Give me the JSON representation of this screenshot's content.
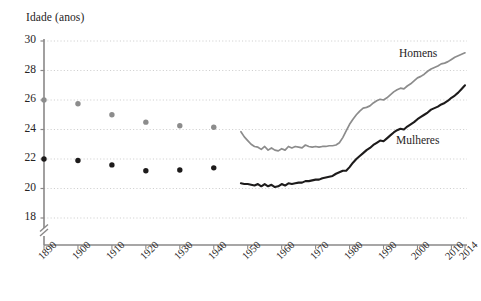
{
  "chart_data": {
    "type": "line",
    "title": "",
    "ylabel": "Idade (anos)",
    "xlabel": "",
    "ylim": [
      17.2,
      30
    ],
    "xlim": [
      1890,
      2014
    ],
    "grid": true,
    "y_axis_break": true,
    "yticks": [
      18,
      20,
      22,
      24,
      26,
      28,
      30
    ],
    "xticks": [
      1890,
      1900,
      1910,
      1920,
      1930,
      1940,
      1950,
      1960,
      1970,
      1980,
      1990,
      2000,
      2010,
      2014
    ],
    "legend_position": "inline-right",
    "series": [
      {
        "name": "Homens",
        "color": "#8c8c8c",
        "marker_points": {
          "x": [
            1890,
            1900,
            1910,
            1920,
            1930,
            1940
          ],
          "y": [
            26.0,
            25.75,
            25.0,
            24.5,
            24.25,
            24.15
          ]
        },
        "line_points": {
          "x": [
            1948,
            1949,
            1950,
            1951,
            1952,
            1953,
            1954,
            1955,
            1956,
            1957,
            1958,
            1959,
            1960,
            1961,
            1962,
            1963,
            1964,
            1965,
            1966,
            1967,
            1968,
            1969,
            1970,
            1971,
            1972,
            1973,
            1974,
            1975,
            1976,
            1977,
            1978,
            1979,
            1980,
            1981,
            1982,
            1983,
            1984,
            1985,
            1986,
            1987,
            1988,
            1989,
            1990,
            1991,
            1992,
            1993,
            1994,
            1995,
            1996,
            1997,
            1998,
            1999,
            2000,
            2001,
            2002,
            2003,
            2004,
            2005,
            2006,
            2007,
            2008,
            2009,
            2010,
            2011,
            2012,
            2013,
            2014
          ],
          "y": [
            23.85,
            23.5,
            23.25,
            23.0,
            22.85,
            22.8,
            22.65,
            22.85,
            22.6,
            22.75,
            22.6,
            22.55,
            22.7,
            22.6,
            22.85,
            22.75,
            22.85,
            22.8,
            22.75,
            22.95,
            22.85,
            22.8,
            22.85,
            22.8,
            22.85,
            22.85,
            22.9,
            22.9,
            22.95,
            23.1,
            23.45,
            23.9,
            24.35,
            24.7,
            25.0,
            25.25,
            25.45,
            25.5,
            25.6,
            25.8,
            25.95,
            26.05,
            26.0,
            26.15,
            26.35,
            26.55,
            26.7,
            26.8,
            26.75,
            26.95,
            27.1,
            27.3,
            27.5,
            27.6,
            27.75,
            27.95,
            28.1,
            28.2,
            28.3,
            28.45,
            28.5,
            28.6,
            28.75,
            28.9,
            29.0,
            29.1,
            29.2
          ]
        }
      },
      {
        "name": "Mulheres",
        "color": "#1d1b1b",
        "marker_points": {
          "x": [
            1890,
            1900,
            1910,
            1920,
            1930,
            1940
          ],
          "y": [
            22.0,
            21.9,
            21.6,
            21.2,
            21.25,
            21.4
          ]
        },
        "line_points": {
          "x": [
            1948,
            1949,
            1950,
            1951,
            1952,
            1953,
            1954,
            1955,
            1956,
            1957,
            1958,
            1959,
            1960,
            1961,
            1962,
            1963,
            1964,
            1965,
            1966,
            1967,
            1968,
            1969,
            1970,
            1971,
            1972,
            1973,
            1974,
            1975,
            1976,
            1977,
            1978,
            1979,
            1980,
            1981,
            1982,
            1983,
            1984,
            1985,
            1986,
            1987,
            1988,
            1989,
            1990,
            1991,
            1992,
            1993,
            1994,
            1995,
            1996,
            1997,
            1998,
            1999,
            2000,
            2001,
            2002,
            2003,
            2004,
            2005,
            2006,
            2007,
            2008,
            2009,
            2010,
            2011,
            2012,
            2013,
            2014
          ],
          "y": [
            20.35,
            20.3,
            20.3,
            20.25,
            20.2,
            20.3,
            20.15,
            20.3,
            20.15,
            20.25,
            20.1,
            20.15,
            20.3,
            20.2,
            20.35,
            20.3,
            20.35,
            20.4,
            20.4,
            20.5,
            20.5,
            20.55,
            20.6,
            20.6,
            20.7,
            20.75,
            20.8,
            20.85,
            21.0,
            21.1,
            21.2,
            21.2,
            21.45,
            21.75,
            22.0,
            22.2,
            22.4,
            22.6,
            22.75,
            22.95,
            23.1,
            23.25,
            23.2,
            23.4,
            23.6,
            23.8,
            23.95,
            24.05,
            24.0,
            24.2,
            24.35,
            24.5,
            24.7,
            24.85,
            25.0,
            25.15,
            25.35,
            25.45,
            25.55,
            25.7,
            25.8,
            25.95,
            26.15,
            26.3,
            26.5,
            26.75,
            27.0
          ]
        }
      }
    ]
  },
  "axis": {
    "y_title": "Idade (anos)",
    "ytick_labels": [
      "30",
      "28",
      "26",
      "24",
      "22",
      "20",
      "18"
    ],
    "xtick_labels": [
      "1890",
      "1900",
      "1910",
      "1920",
      "1930",
      "1940",
      "1950",
      "1960",
      "1970",
      "1980",
      "1990",
      "2000",
      "2010",
      "2014"
    ]
  },
  "labels": {
    "homens": "Homens",
    "mulheres": "Mulheres"
  },
  "colors": {
    "homens_line": "#8c8c8c",
    "mulheres_line": "#1d1b1b",
    "axis": "#8a8888",
    "grid": "#c9c9c9",
    "text": "#262323",
    "background": "#ffffff"
  }
}
